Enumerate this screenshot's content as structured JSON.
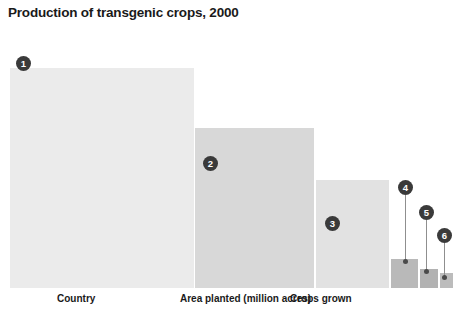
{
  "chart_data": {
    "type": "bar",
    "title": "Production of transgenic crops, 2000",
    "xlabel": "",
    "ylabel": "",
    "grid": false,
    "legend": "none",
    "categories": [
      "1",
      "2",
      "3",
      "4",
      "5",
      "6"
    ],
    "values": [
      68.4,
      30.0,
      16.5,
      3.0,
      1.6,
      0.7
    ],
    "value_unit": "million acres",
    "bars": [
      {
        "rank": "1",
        "value": 68.4,
        "left_pct": 2.0,
        "width_pct": 41.0,
        "height_pct": 85.0,
        "color": "#ebebeb"
      },
      {
        "rank": "2",
        "value": 30.0,
        "left_pct": 42.7,
        "width_pct": 26.7,
        "height_pct": 62.0,
        "color": "#d8d8d8"
      },
      {
        "rank": "3",
        "value": 16.5,
        "left_pct": 69.4,
        "width_pct": 16.5,
        "height_pct": 42.0,
        "color": "#e2e2e2"
      },
      {
        "rank": "4",
        "value": 3.0,
        "left_pct": 85.9,
        "width_pct": 6.4,
        "height_pct": 11.5,
        "color": "#b9b9b9"
      },
      {
        "rank": "5",
        "value": 1.6,
        "left_pct": 92.3,
        "width_pct": 4.4,
        "height_pct": 7.7,
        "color": "#b2b2b2"
      },
      {
        "rank": "6",
        "value": 0.7,
        "left_pct": 96.7,
        "width_pct": 3.3,
        "height_pct": 6.2,
        "color": "#bcbcbc"
      }
    ],
    "badges": [
      {
        "label": "1",
        "x_px": 16,
        "y_px": 56
      },
      {
        "label": "2",
        "x_px": 203,
        "y_px": 156
      },
      {
        "label": "3",
        "x_px": 325,
        "y_px": 216
      },
      {
        "label": "4",
        "x_px": 398,
        "y_px": 180
      },
      {
        "label": "5",
        "x_px": 419,
        "y_px": 205
      },
      {
        "label": "6",
        "x_px": 437,
        "y_px": 228
      }
    ],
    "stems": [
      {
        "for": "4",
        "x_px": 405,
        "top_px": 195,
        "bottom_px": 262
      },
      {
        "for": "5",
        "x_px": 426,
        "top_px": 220,
        "bottom_px": 272
      },
      {
        "for": "6",
        "x_px": 444,
        "top_px": 243,
        "bottom_px": 278
      }
    ],
    "axis_labels": [
      {
        "text": "Country",
        "x_px": 57
      },
      {
        "text": "Area planted (million acres)",
        "x_px": 180
      },
      {
        "text": "Crops grown",
        "x_px": 290
      }
    ],
    "colors": {
      "background": "#ffffff",
      "badge_fill": "#3a3a3a",
      "badge_text": "#ffffff",
      "stem": "#8f8f8f",
      "stem_dot": "#4a4a4a",
      "text": "#1a1a1a"
    }
  }
}
